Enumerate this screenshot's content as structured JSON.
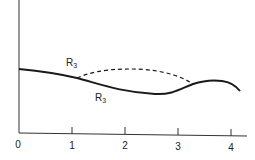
{
  "diagram": {
    "axes": {
      "x_ticks": [
        {
          "label": "0",
          "x": 19
        },
        {
          "label": "1",
          "x": 72
        },
        {
          "label": "2",
          "x": 125
        },
        {
          "label": "3",
          "x": 178
        },
        {
          "label": "4",
          "x": 231
        }
      ]
    },
    "curves": [
      {
        "name": "solid-path",
        "style": "solid",
        "label_main": "R",
        "label_sub": "3"
      },
      {
        "name": "dashed-path",
        "style": "dashed",
        "label_main": "R",
        "label_sub": "3"
      }
    ],
    "colors": {
      "line": "#1a1a1a",
      "axis": "#333333",
      "background": "#ffffff"
    }
  }
}
